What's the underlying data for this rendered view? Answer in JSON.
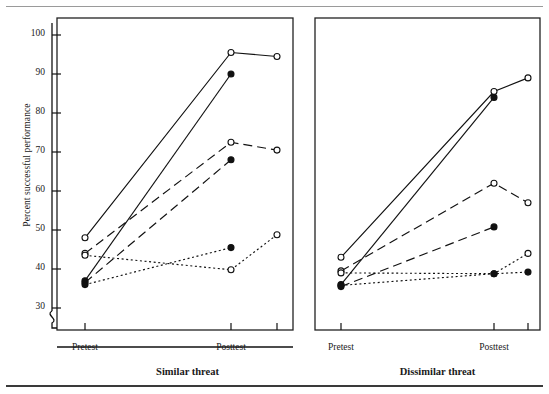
{
  "figure": {
    "ylabel": "Percent successful performance",
    "panels": [
      {
        "caption": "Similar threat"
      },
      {
        "caption": "Dissimilar threat"
      }
    ]
  },
  "axis": {
    "y_ticks": [
      30,
      40,
      50,
      60,
      70,
      80,
      90,
      100
    ],
    "y_tick_labels": [
      "30",
      "40",
      "50",
      "60",
      "70",
      "80",
      "90",
      "100"
    ],
    "x_tick_labels": [
      "Pretest",
      "Posttest"
    ],
    "break_symbol": "axis-break-zigzag"
  },
  "chart_data": {
    "type": "line",
    "title": "",
    "xlabel": "",
    "ylabel": "Percent successful performance",
    "ylim": [
      28,
      103
    ],
    "grid": false,
    "legend": "none",
    "x": [
      "Pretest",
      "Posttest",
      "Follow-up"
    ],
    "x_tick_labels": [
      "Pretest",
      "Posttest"
    ],
    "panels": [
      {
        "name": "Similar threat",
        "caption": "Similar threat",
        "series": [
          {
            "name": "solid-open-1",
            "line": "solid",
            "marker": "open-circle",
            "values": [
              48,
              95.5,
              94.5
            ]
          },
          {
            "name": "solid-filled-1",
            "line": "solid",
            "marker": "filled-circle",
            "values": [
              37,
              90,
              null
            ]
          },
          {
            "name": "dashed-open-1",
            "line": "dashed",
            "marker": "open-circle",
            "values": [
              44,
              72.5,
              70.5
            ]
          },
          {
            "name": "dashed-filled-1",
            "line": "dashed",
            "marker": "filled-circle",
            "values": [
              36.5,
              68,
              null
            ]
          },
          {
            "name": "dotted-open-1",
            "line": "dotted",
            "marker": "open-circle",
            "values": [
              43.5,
              39.8,
              48.8
            ]
          },
          {
            "name": "dotted-filled-1",
            "line": "dotted",
            "marker": "filled-circle",
            "values": [
              36,
              45.5,
              null
            ]
          }
        ]
      },
      {
        "name": "Dissimilar threat",
        "caption": "Dissimilar threat",
        "series": [
          {
            "name": "solid-open-2",
            "line": "solid",
            "marker": "open-circle",
            "values": [
              43,
              85.5,
              89
            ]
          },
          {
            "name": "solid-filled-2",
            "line": "solid",
            "marker": "filled-circle",
            "values": [
              36,
              84,
              null
            ]
          },
          {
            "name": "dashed-open-2",
            "line": "dashed",
            "marker": "open-circle",
            "values": [
              39.5,
              62,
              57
            ]
          },
          {
            "name": "dashed-filled-2",
            "line": "dashed",
            "marker": "filled-circle",
            "values": [
              35.5,
              50.8,
              null
            ]
          },
          {
            "name": "dotted-open-2",
            "line": "dotted",
            "marker": "open-circle",
            "values": [
              39,
              38.8,
              44
            ]
          },
          {
            "name": "dotted-filled-2",
            "line": "dotted",
            "marker": "filled-circle",
            "values": [
              35.8,
              38.8,
              39.2
            ]
          }
        ]
      }
    ]
  },
  "colors": {
    "ink": "#111111",
    "rule_top": "#9a9a9a",
    "rule_bottom": "#3a3a3a",
    "panel_border": "#222222",
    "background": "#ffffff"
  }
}
